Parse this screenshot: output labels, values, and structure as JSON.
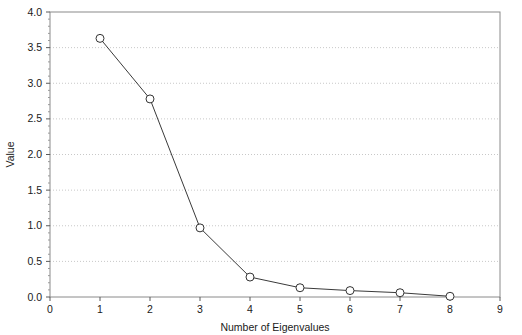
{
  "chart_data": {
    "type": "line",
    "title": "",
    "subtitle": "",
    "xlabel": "Number of Eigenvalues",
    "ylabel": "Value",
    "x": [
      1,
      2,
      3,
      4,
      5,
      6,
      7,
      8
    ],
    "values": [
      3.63,
      2.78,
      0.97,
      0.28,
      0.13,
      0.09,
      0.06,
      0.01
    ],
    "series": [
      {
        "name": "Eigenvalue",
        "values": [
          3.63,
          2.78,
          0.97,
          0.28,
          0.13,
          0.09,
          0.06,
          0.01
        ]
      }
    ],
    "xlim": [
      0,
      9
    ],
    "ylim": [
      0.0,
      4.0
    ],
    "xticks": [
      0,
      1,
      2,
      3,
      4,
      5,
      6,
      7,
      8,
      9
    ],
    "xticklabels": [
      "0",
      "1",
      "2",
      "3",
      "4",
      "5",
      "6",
      "7",
      "8",
      "9"
    ],
    "yticks": [
      0.0,
      0.5,
      1.0,
      1.5,
      2.0,
      2.5,
      3.0,
      3.5,
      4.0
    ],
    "yticklabels": [
      "0.0",
      "0.5",
      "1.0",
      "1.5",
      "2.0",
      "2.5",
      "3.0",
      "3.5",
      "4.0"
    ],
    "grid": {
      "horizontal": true,
      "vertical": false,
      "style": "dotted",
      "color": "#c8c8c8"
    },
    "legend": {
      "visible": false,
      "position": "none",
      "entries": []
    },
    "marker": {
      "shape": "circle-open",
      "size": 4,
      "edge_color": "#333333",
      "face_color": "#ffffff"
    },
    "line": {
      "color": "#3a3a3a",
      "width": 1
    },
    "frame": {
      "color": "#8a8a8a",
      "box": true
    },
    "annotations": []
  },
  "layout": {
    "plot_left": 50,
    "plot_right": 500,
    "plot_top": 12,
    "plot_bottom": 297,
    "width": 522,
    "height": 335
  }
}
